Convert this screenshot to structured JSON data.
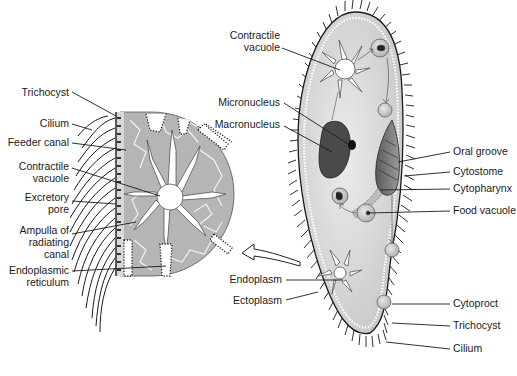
{
  "diagram": {
    "colors": {
      "cytoplasm": "#d6d6d6",
      "inset_cytoplasm": "#b3b3b3",
      "nucleus": "#4a4a4a",
      "outline": "#1a1a1a",
      "background": "#ffffff"
    },
    "inset_labels": [
      {
        "id": "trichocyst",
        "lines": [
          "Trichocyst"
        ]
      },
      {
        "id": "cilium",
        "lines": [
          "Cilium"
        ]
      },
      {
        "id": "feeder-canal",
        "lines": [
          "Feeder canal"
        ]
      },
      {
        "id": "contractile-vacuole",
        "lines": [
          "Contractile",
          "vacuole"
        ]
      },
      {
        "id": "excretory-pore",
        "lines": [
          "Excretory",
          "pore"
        ]
      },
      {
        "id": "ampulla",
        "lines": [
          "Ampulla of",
          "radiating",
          "canal"
        ]
      },
      {
        "id": "endoplasmic-reticulum",
        "lines": [
          "Endoplasmic",
          "reticulum"
        ]
      }
    ],
    "body_left_labels": [
      {
        "id": "contractile-vacuole",
        "lines": [
          "Contractile",
          "vacuole"
        ]
      },
      {
        "id": "micronucleus",
        "lines": [
          "Micronucleus"
        ]
      },
      {
        "id": "macronucleus",
        "lines": [
          "Macronucleus"
        ]
      },
      {
        "id": "endoplasm",
        "lines": [
          "Endoplasm"
        ]
      },
      {
        "id": "ectoplasm",
        "lines": [
          "Ectoplasm"
        ]
      }
    ],
    "body_right_labels": [
      {
        "id": "oral-groove",
        "lines": [
          "Oral groove"
        ]
      },
      {
        "id": "cytostome",
        "lines": [
          "Cytostome"
        ]
      },
      {
        "id": "cytopharynx",
        "lines": [
          "Cytopharynx"
        ]
      },
      {
        "id": "food-vacuole",
        "lines": [
          "Food vacuole"
        ]
      },
      {
        "id": "cytoproct",
        "lines": [
          "Cytoproct"
        ]
      },
      {
        "id": "trichocyst",
        "lines": [
          "Trichocyst"
        ]
      },
      {
        "id": "cilium",
        "lines": [
          "Cilium"
        ]
      }
    ]
  }
}
